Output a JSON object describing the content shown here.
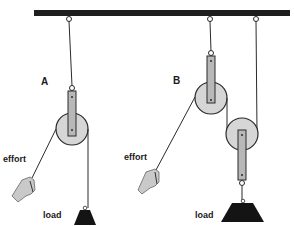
{
  "diagram": {
    "type": "pulley-systems",
    "labels": {
      "system_a": "A",
      "system_b": "B",
      "effort_a": "effort",
      "effort_b": "effort",
      "load_a": "load",
      "load_b": "load"
    },
    "colors": {
      "beam": "#1e1e1e",
      "pulley_fill": "#d6d6d6",
      "strap_fill": "#b8b8b8",
      "outline": "#2a2a2a",
      "load": "#141414",
      "hand": "#c9c9c9"
    }
  }
}
